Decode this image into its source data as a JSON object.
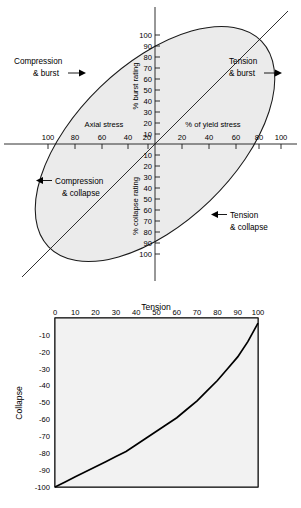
{
  "figure_top": {
    "name": "stress-ellipse-diagram",
    "description": "Tilted ellipse envelope of combined axial stress versus burst/collapse rating",
    "axes": {
      "x_label_left": "Axial stress",
      "x_label_right": "% of yield stress",
      "y_label_top": "% burst rating",
      "y_label_bottom": "% collapse rating",
      "x_ticks_left": [
        "100",
        "80",
        "60",
        "40",
        "20"
      ],
      "x_ticks_right": [
        "20",
        "40",
        "60",
        "80",
        "100"
      ],
      "y_ticks_top": [
        "100",
        "90",
        "80",
        "70",
        "60",
        "50",
        "40",
        "30",
        "20",
        "10"
      ],
      "y_ticks_bottom": [
        "10",
        "20",
        "30",
        "40",
        "50",
        "60",
        "70",
        "80",
        "90",
        "100"
      ]
    },
    "callouts": [
      {
        "id": "compression-burst",
        "line1": "Compression",
        "line2": "& burst",
        "arrow": "right"
      },
      {
        "id": "tension-burst",
        "line1": "Tension",
        "line2": "& burst",
        "arrow": "right"
      },
      {
        "id": "compression-collapse",
        "line1": "Compression",
        "line2": "& collapse",
        "arrow": "left"
      },
      {
        "id": "tension-collapse",
        "line1": "Tension",
        "line2": "& collapse",
        "arrow": "left"
      }
    ],
    "colors": {
      "ellipse_fill": "#ebebeb",
      "ellipse_stroke": "#1a1a1a",
      "axis": "#1a1a1a"
    }
  },
  "chart_data": {
    "type": "line",
    "title": "",
    "xlabel": "Tension",
    "ylabel": "Collapse",
    "xlim": [
      0,
      100
    ],
    "ylim": [
      -100,
      0
    ],
    "grid": true,
    "grid_major_step": 10,
    "grid_minor_step": 2,
    "legend": "none",
    "x_ticks": [
      0,
      10,
      20,
      30,
      40,
      50,
      60,
      70,
      80,
      90,
      100
    ],
    "y_ticks": [
      -10,
      -20,
      -30,
      -40,
      -50,
      -60,
      -70,
      -80,
      -90,
      -100
    ],
    "x_tick_labels": [
      "0",
      "10",
      "20",
      "30",
      "40",
      "50",
      "60",
      "70",
      "80",
      "90",
      "100"
    ],
    "y_tick_labels": [
      "-10",
      "-20",
      "-30",
      "-40",
      "-50",
      "-60",
      "-70",
      "-80",
      "-90",
      "-100"
    ],
    "series": [
      {
        "name": "Tension-collapse derating",
        "x": [
          0,
          5,
          10,
          15,
          20,
          25,
          30,
          35,
          40,
          45,
          50,
          55,
          60,
          65,
          70,
          75,
          80,
          85,
          90,
          95,
          100
        ],
        "y": [
          -100,
          -97,
          -94,
          -91,
          -88,
          -85,
          -82,
          -79,
          -75,
          -71,
          -67,
          -63,
          -59,
          -54,
          -49,
          -43,
          -37,
          -30,
          -23,
          -14,
          -3
        ]
      }
    ]
  },
  "caption": {
    "text": ""
  }
}
